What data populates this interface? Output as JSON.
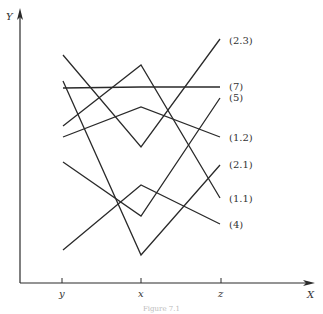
{
  "figure": {
    "caption": "Figure 7.1",
    "axes": {
      "y_label": "Y",
      "x_label": "X",
      "ticks": [
        {
          "label": "y",
          "x": 62
        },
        {
          "label": "x",
          "x": 141
        },
        {
          "label": "z",
          "x": 221
        }
      ]
    },
    "colors": {
      "ink": "#2a2a2a",
      "text": "#333333"
    },
    "lines": [
      {
        "label": "(2.3)",
        "points": [
          [
            63,
            55
          ],
          [
            141,
            147
          ],
          [
            220,
            39
          ]
        ],
        "label_pos": [
          229,
          44
        ]
      },
      {
        "label": "(7)",
        "points": [
          [
            63,
            88
          ],
          [
            141,
            87
          ],
          [
            220,
            87
          ]
        ],
        "label_pos": [
          229,
          90
        ]
      },
      {
        "label": "(5)",
        "points": [
          [
            63,
            162
          ],
          [
            141,
            216
          ],
          [
            220,
            98
          ]
        ],
        "label_pos": [
          229,
          101
        ]
      },
      {
        "label": "(1.2)",
        "points": [
          [
            63,
            137
          ],
          [
            141,
            107
          ],
          [
            220,
            137
          ]
        ],
        "label_pos": [
          229,
          141
        ]
      },
      {
        "label": "(2.1)",
        "points": [
          [
            63,
            81
          ],
          [
            141,
            255
          ],
          [
            220,
            165
          ]
        ],
        "label_pos": [
          229,
          168
        ]
      },
      {
        "label": "(1.1)",
        "points": [
          [
            63,
            126
          ],
          [
            141,
            65
          ],
          [
            220,
            198
          ]
        ],
        "label_pos": [
          229,
          202
        ]
      },
      {
        "label": "(4)",
        "points": [
          [
            63,
            250
          ],
          [
            141,
            185
          ],
          [
            220,
            224
          ]
        ],
        "label_pos": [
          229,
          228
        ]
      }
    ]
  }
}
